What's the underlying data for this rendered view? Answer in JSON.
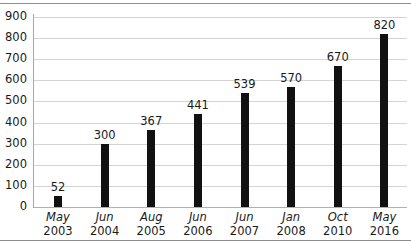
{
  "chart_data": {
    "type": "bar",
    "title": "",
    "subtitle": "",
    "xlabel": "",
    "ylabel": "",
    "categories": [
      "May 2003",
      "Jun 2004",
      "Aug 2005",
      "Jun 2006",
      "Jun 2007",
      "Jan 2008",
      "Oct 2010",
      "May 2016"
    ],
    "category_months": [
      "May",
      "Jun",
      "Aug",
      "Jun",
      "Jun",
      "Jan",
      "Oct",
      "May"
    ],
    "category_years": [
      "2003",
      "2004",
      "2005",
      "2006",
      "2007",
      "2008",
      "2010",
      "2016"
    ],
    "values": [
      52,
      300,
      367,
      441,
      539,
      570,
      670,
      820
    ],
    "value_labels": [
      "52",
      "300",
      "367",
      "441",
      "539",
      "570",
      "670",
      "820"
    ],
    "ylim": [
      0,
      900
    ],
    "ytick_values": [
      0,
      100,
      200,
      300,
      400,
      500,
      600,
      700,
      800,
      900
    ],
    "ytick_labels": [
      "0",
      "100",
      "200",
      "300",
      "400",
      "500",
      "600",
      "700",
      "800",
      "900"
    ],
    "grid": true,
    "legend": false,
    "legend_position": "none",
    "bar_color": "#111111",
    "gridline_color": "#d4d4d4",
    "axis_color": "#a6a6a6",
    "background_color": "#ffffff",
    "text_color": "#1a1a1a"
  }
}
